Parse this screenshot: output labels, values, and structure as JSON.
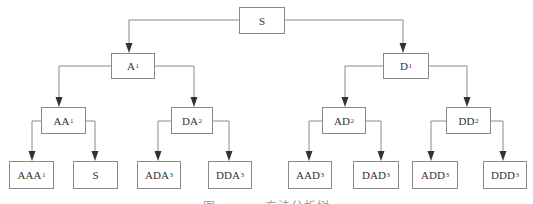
{
  "diagram": {
    "type": "tree",
    "root": "S",
    "nodes": [
      {
        "id": "n_s",
        "label": "S",
        "sub": "",
        "x": 239,
        "y": 7,
        "w": 46,
        "h": 27
      },
      {
        "id": "n_a1",
        "label": "A",
        "sub": "1",
        "x": 111,
        "y": 53,
        "w": 44,
        "h": 26
      },
      {
        "id": "n_d1",
        "label": "D",
        "sub": "1",
        "x": 383,
        "y": 53,
        "w": 46,
        "h": 26
      },
      {
        "id": "n_aa1",
        "label": "AA",
        "sub": "1",
        "x": 41,
        "y": 107,
        "w": 45,
        "h": 27
      },
      {
        "id": "n_da2",
        "label": "DA",
        "sub": "2",
        "x": 171,
        "y": 107,
        "w": 42,
        "h": 27
      },
      {
        "id": "n_ad2",
        "label": "AD",
        "sub": "2",
        "x": 322,
        "y": 107,
        "w": 44,
        "h": 27
      },
      {
        "id": "n_dd2",
        "label": "DD",
        "sub": "2",
        "x": 446,
        "y": 107,
        "w": 45,
        "h": 27
      },
      {
        "id": "n_aaa1",
        "label": "AAA",
        "sub": "1",
        "x": 9,
        "y": 161,
        "w": 45,
        "h": 28
      },
      {
        "id": "n_s2",
        "label": "S",
        "sub": "",
        "x": 73,
        "y": 161,
        "w": 45,
        "h": 28
      },
      {
        "id": "n_ada3",
        "label": "ADA",
        "sub": "3",
        "x": 137,
        "y": 161,
        "w": 44,
        "h": 28
      },
      {
        "id": "n_dda3",
        "label": "DDA",
        "sub": "3",
        "x": 208,
        "y": 161,
        "w": 44,
        "h": 28
      },
      {
        "id": "n_aad3",
        "label": "AAD",
        "sub": "3",
        "x": 288,
        "y": 161,
        "w": 44,
        "h": 28
      },
      {
        "id": "n_dad3",
        "label": "DAD",
        "sub": "3",
        "x": 353,
        "y": 161,
        "w": 46,
        "h": 28
      },
      {
        "id": "n_add3",
        "label": "ADD",
        "sub": "3",
        "x": 412,
        "y": 161,
        "w": 46,
        "h": 28
      },
      {
        "id": "n_ddd3",
        "label": "DDD",
        "sub": "3",
        "x": 483,
        "y": 161,
        "w": 44,
        "h": 28
      }
    ],
    "edges": [
      {
        "from": "S",
        "to": "A1",
        "path": [
          [
            239,
            20
          ],
          [
            129,
            20
          ],
          [
            129,
            53
          ]
        ]
      },
      {
        "from": "S",
        "to": "D1",
        "path": [
          [
            285,
            20
          ],
          [
            403,
            20
          ],
          [
            403,
            53
          ]
        ]
      },
      {
        "from": "A1",
        "to": "AA1",
        "path": [
          [
            111,
            66
          ],
          [
            59,
            66
          ],
          [
            59,
            107
          ]
        ]
      },
      {
        "from": "A1",
        "to": "DA2",
        "path": [
          [
            155,
            66
          ],
          [
            194,
            66
          ],
          [
            194,
            107
          ]
        ]
      },
      {
        "from": "D1",
        "to": "AD2",
        "path": [
          [
            383,
            66
          ],
          [
            345,
            66
          ],
          [
            345,
            107
          ]
        ]
      },
      {
        "from": "D1",
        "to": "DD2",
        "path": [
          [
            429,
            66
          ],
          [
            467,
            66
          ],
          [
            467,
            107
          ]
        ]
      },
      {
        "from": "AA1",
        "to": "AAA1",
        "path": [
          [
            41,
            121
          ],
          [
            32,
            121
          ],
          [
            32,
            161
          ]
        ]
      },
      {
        "from": "AA1",
        "to": "S",
        "path": [
          [
            86,
            121
          ],
          [
            95,
            121
          ],
          [
            95,
            161
          ]
        ]
      },
      {
        "from": "DA2",
        "to": "ADA3",
        "path": [
          [
            171,
            121
          ],
          [
            158,
            121
          ],
          [
            158,
            161
          ]
        ]
      },
      {
        "from": "DA2",
        "to": "DDA3",
        "path": [
          [
            213,
            121
          ],
          [
            229,
            121
          ],
          [
            229,
            161
          ]
        ]
      },
      {
        "from": "AD2",
        "to": "AAD3",
        "path": [
          [
            322,
            121
          ],
          [
            309,
            121
          ],
          [
            309,
            161
          ]
        ]
      },
      {
        "from": "AD2",
        "to": "DAD3",
        "path": [
          [
            366,
            121
          ],
          [
            381,
            121
          ],
          [
            381,
            161
          ]
        ]
      },
      {
        "from": "DD2",
        "to": "ADD3",
        "path": [
          [
            446,
            121
          ],
          [
            431,
            121
          ],
          [
            431,
            161
          ]
        ]
      },
      {
        "from": "DD2",
        "to": "DDD3",
        "path": [
          [
            491,
            121
          ],
          [
            503,
            121
          ],
          [
            503,
            161
          ]
        ]
      }
    ],
    "colors": {
      "line": "#8a8a8a",
      "arrow": "#333333",
      "text": "#333333",
      "caption": "#9a9a9a"
    }
  },
  "caption": "图 ········ 方法分析树"
}
